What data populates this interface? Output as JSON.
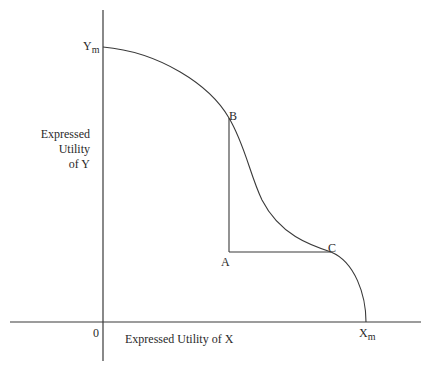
{
  "diagram": {
    "title": "",
    "y_axis": {
      "label_lines": [
        "Expressed",
        "Utility",
        "of Y"
      ],
      "max_label": "Y",
      "max_sub": "m"
    },
    "x_axis": {
      "label": "Expressed Utility of X",
      "max_label": "X",
      "max_sub": "m",
      "origin_label": "0"
    },
    "points": {
      "A": "A",
      "B": "B",
      "C": "C"
    },
    "colors": {
      "line": "#3a3a3a",
      "background": "#ffffff"
    }
  }
}
